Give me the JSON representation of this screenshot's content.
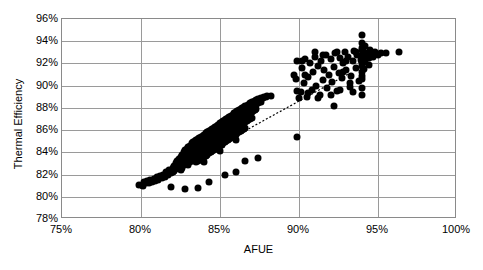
{
  "chart_data": {
    "type": "scatter",
    "title": "",
    "xlabel": "AFUE",
    "ylabel": "Thermal Efficiency",
    "xlim": [
      75,
      100
    ],
    "ylim": [
      78,
      96
    ],
    "grid": true,
    "legend": "none",
    "xtick_labels": [
      "75%",
      "80%",
      "85%",
      "90%",
      "95%",
      "100%"
    ],
    "xtick_values": [
      75,
      80,
      85,
      90,
      95,
      100
    ],
    "ytick_labels": [
      "78%",
      "80%",
      "82%",
      "84%",
      "86%",
      "88%",
      "90%",
      "92%",
      "94%",
      "96%"
    ],
    "ytick_values": [
      78,
      80,
      82,
      84,
      86,
      88,
      90,
      92,
      94,
      96
    ],
    "marker": {
      "shape": "circle",
      "color": "#000000",
      "size_px": 7
    },
    "trendline": {
      "style": "dotted",
      "color": "#000000",
      "x": [
        80.0,
        93.2
      ],
      "y": [
        80.6,
        91.0
      ]
    },
    "annotations": [],
    "points": [
      [
        79.9,
        81.1
      ],
      [
        80.1,
        81.0
      ],
      [
        80.2,
        81.3
      ],
      [
        80.3,
        81.2
      ],
      [
        80.4,
        81.4
      ],
      [
        80.5,
        81.2
      ],
      [
        80.6,
        81.5
      ],
      [
        80.7,
        81.3
      ],
      [
        80.8,
        81.6
      ],
      [
        80.9,
        81.4
      ],
      [
        81.0,
        81.8
      ],
      [
        81.1,
        81.5
      ],
      [
        81.2,
        81.9
      ],
      [
        81.3,
        81.7
      ],
      [
        81.4,
        82.0
      ],
      [
        81.5,
        81.8
      ],
      [
        81.6,
        82.2
      ],
      [
        81.7,
        82.0
      ],
      [
        81.8,
        82.4
      ],
      [
        81.9,
        82.1
      ],
      [
        82.0,
        82.6
      ],
      [
        82.0,
        82.2
      ],
      [
        82.1,
        82.8
      ],
      [
        82.1,
        82.3
      ],
      [
        82.2,
        83.0
      ],
      [
        82.2,
        82.5
      ],
      [
        82.3,
        83.2
      ],
      [
        82.3,
        82.6
      ],
      [
        82.4,
        83.4
      ],
      [
        82.4,
        82.8
      ],
      [
        82.5,
        83.6
      ],
      [
        82.5,
        83.0
      ],
      [
        82.5,
        82.4
      ],
      [
        82.6,
        83.8
      ],
      [
        82.6,
        83.2
      ],
      [
        82.6,
        82.6
      ],
      [
        82.7,
        84.0
      ],
      [
        82.7,
        83.4
      ],
      [
        82.7,
        82.9
      ],
      [
        82.8,
        84.2
      ],
      [
        82.8,
        83.6
      ],
      [
        82.8,
        83.1
      ],
      [
        82.9,
        84.3
      ],
      [
        82.9,
        83.8
      ],
      [
        82.9,
        83.3
      ],
      [
        83.0,
        84.5
      ],
      [
        83.0,
        84.0
      ],
      [
        83.0,
        83.5
      ],
      [
        83.0,
        82.9
      ],
      [
        83.1,
        84.6
      ],
      [
        83.1,
        84.1
      ],
      [
        83.1,
        83.6
      ],
      [
        83.1,
        83.1
      ],
      [
        83.2,
        84.8
      ],
      [
        83.2,
        84.3
      ],
      [
        83.2,
        83.8
      ],
      [
        83.2,
        83.3
      ],
      [
        83.3,
        84.9
      ],
      [
        83.3,
        84.4
      ],
      [
        83.3,
        83.9
      ],
      [
        83.3,
        83.4
      ],
      [
        83.4,
        85.0
      ],
      [
        83.4,
        84.5
      ],
      [
        83.4,
        84.0
      ],
      [
        83.4,
        83.5
      ],
      [
        83.5,
        85.1
      ],
      [
        83.5,
        84.6
      ],
      [
        83.5,
        84.1
      ],
      [
        83.5,
        83.6
      ],
      [
        83.5,
        83.1
      ],
      [
        83.6,
        85.2
      ],
      [
        83.6,
        84.7
      ],
      [
        83.6,
        84.2
      ],
      [
        83.6,
        83.7
      ],
      [
        83.6,
        83.2
      ],
      [
        83.7,
        85.3
      ],
      [
        83.7,
        84.8
      ],
      [
        83.7,
        84.3
      ],
      [
        83.7,
        83.8
      ],
      [
        83.7,
        83.3
      ],
      [
        83.8,
        85.4
      ],
      [
        83.8,
        84.9
      ],
      [
        83.8,
        84.4
      ],
      [
        83.8,
        83.9
      ],
      [
        83.8,
        83.4
      ],
      [
        83.9,
        85.5
      ],
      [
        83.9,
        85.0
      ],
      [
        83.9,
        84.5
      ],
      [
        83.9,
        84.0
      ],
      [
        83.9,
        83.5
      ],
      [
        84.0,
        85.6
      ],
      [
        84.0,
        85.1
      ],
      [
        84.0,
        84.6
      ],
      [
        84.0,
        84.1
      ],
      [
        84.0,
        83.6
      ],
      [
        84.0,
        83.1
      ],
      [
        84.1,
        85.7
      ],
      [
        84.1,
        85.2
      ],
      [
        84.1,
        84.7
      ],
      [
        84.1,
        84.2
      ],
      [
        84.1,
        83.7
      ],
      [
        84.2,
        85.8
      ],
      [
        84.2,
        85.3
      ],
      [
        84.2,
        84.8
      ],
      [
        84.2,
        84.3
      ],
      [
        84.2,
        83.8
      ],
      [
        84.3,
        85.9
      ],
      [
        84.3,
        85.4
      ],
      [
        84.3,
        84.9
      ],
      [
        84.3,
        84.4
      ],
      [
        84.3,
        83.9
      ],
      [
        84.4,
        86.0
      ],
      [
        84.4,
        85.5
      ],
      [
        84.4,
        85.0
      ],
      [
        84.4,
        84.5
      ],
      [
        84.4,
        84.0
      ],
      [
        84.5,
        86.1
      ],
      [
        84.5,
        85.6
      ],
      [
        84.5,
        85.1
      ],
      [
        84.5,
        84.6
      ],
      [
        84.5,
        84.1
      ],
      [
        84.6,
        86.2
      ],
      [
        84.6,
        85.7
      ],
      [
        84.6,
        85.2
      ],
      [
        84.6,
        84.7
      ],
      [
        84.6,
        84.2
      ],
      [
        84.7,
        86.3
      ],
      [
        84.7,
        85.8
      ],
      [
        84.7,
        85.3
      ],
      [
        84.7,
        84.8
      ],
      [
        84.7,
        84.3
      ],
      [
        84.8,
        86.4
      ],
      [
        84.8,
        85.9
      ],
      [
        84.8,
        85.4
      ],
      [
        84.8,
        84.9
      ],
      [
        84.8,
        84.4
      ],
      [
        84.9,
        86.5
      ],
      [
        84.9,
        86.0
      ],
      [
        84.9,
        85.5
      ],
      [
        84.9,
        85.0
      ],
      [
        84.9,
        84.5
      ],
      [
        85.0,
        86.6
      ],
      [
        85.0,
        86.1
      ],
      [
        85.0,
        85.6
      ],
      [
        85.0,
        85.1
      ],
      [
        85.0,
        84.6
      ],
      [
        85.0,
        84.1
      ],
      [
        85.1,
        86.7
      ],
      [
        85.1,
        86.2
      ],
      [
        85.1,
        85.7
      ],
      [
        85.1,
        85.2
      ],
      [
        85.1,
        84.7
      ],
      [
        85.2,
        86.8
      ],
      [
        85.2,
        86.3
      ],
      [
        85.2,
        85.8
      ],
      [
        85.2,
        85.3
      ],
      [
        85.2,
        84.8
      ],
      [
        85.3,
        86.9
      ],
      [
        85.3,
        86.4
      ],
      [
        85.3,
        85.9
      ],
      [
        85.3,
        85.4
      ],
      [
        85.3,
        84.9
      ],
      [
        85.4,
        87.0
      ],
      [
        85.4,
        86.5
      ],
      [
        85.4,
        86.0
      ],
      [
        85.4,
        85.5
      ],
      [
        85.4,
        85.0
      ],
      [
        85.5,
        87.1
      ],
      [
        85.5,
        86.6
      ],
      [
        85.5,
        86.1
      ],
      [
        85.5,
        85.6
      ],
      [
        85.5,
        85.1
      ],
      [
        85.6,
        87.2
      ],
      [
        85.6,
        86.7
      ],
      [
        85.6,
        86.2
      ],
      [
        85.6,
        85.7
      ],
      [
        85.6,
        85.2
      ],
      [
        85.7,
        87.3
      ],
      [
        85.7,
        86.8
      ],
      [
        85.7,
        86.3
      ],
      [
        85.7,
        85.8
      ],
      [
        85.7,
        85.3
      ],
      [
        85.8,
        87.4
      ],
      [
        85.8,
        86.9
      ],
      [
        85.8,
        86.4
      ],
      [
        85.8,
        85.9
      ],
      [
        85.8,
        85.4
      ],
      [
        85.9,
        87.5
      ],
      [
        85.9,
        87.0
      ],
      [
        85.9,
        86.5
      ],
      [
        85.9,
        86.0
      ],
      [
        85.9,
        85.5
      ],
      [
        86.0,
        87.6
      ],
      [
        86.0,
        87.1
      ],
      [
        86.0,
        86.6
      ],
      [
        86.0,
        86.1
      ],
      [
        86.0,
        85.6
      ],
      [
        86.0,
        85.1
      ],
      [
        86.1,
        87.7
      ],
      [
        86.1,
        87.2
      ],
      [
        86.1,
        86.7
      ],
      [
        86.1,
        86.2
      ],
      [
        86.1,
        85.7
      ],
      [
        86.2,
        87.8
      ],
      [
        86.2,
        87.3
      ],
      [
        86.2,
        86.8
      ],
      [
        86.2,
        86.3
      ],
      [
        86.2,
        85.8
      ],
      [
        86.3,
        87.9
      ],
      [
        86.3,
        87.4
      ],
      [
        86.3,
        86.9
      ],
      [
        86.3,
        86.4
      ],
      [
        86.3,
        85.9
      ],
      [
        86.4,
        88.0
      ],
      [
        86.4,
        87.5
      ],
      [
        86.4,
        87.0
      ],
      [
        86.4,
        86.5
      ],
      [
        86.4,
        86.0
      ],
      [
        86.5,
        88.1
      ],
      [
        86.5,
        87.6
      ],
      [
        86.5,
        87.1
      ],
      [
        86.5,
        86.6
      ],
      [
        86.5,
        86.1
      ],
      [
        86.6,
        88.2
      ],
      [
        86.6,
        87.7
      ],
      [
        86.6,
        87.2
      ],
      [
        86.6,
        86.7
      ],
      [
        86.6,
        86.2
      ],
      [
        86.7,
        88.2
      ],
      [
        86.7,
        87.8
      ],
      [
        86.7,
        87.3
      ],
      [
        86.7,
        86.8
      ],
      [
        86.8,
        88.3
      ],
      [
        86.8,
        87.9
      ],
      [
        86.8,
        87.4
      ],
      [
        86.8,
        86.9
      ],
      [
        86.9,
        88.4
      ],
      [
        86.9,
        88.0
      ],
      [
        86.9,
        87.5
      ],
      [
        86.9,
        87.0
      ],
      [
        87.0,
        88.5
      ],
      [
        87.0,
        88.1
      ],
      [
        87.0,
        87.6
      ],
      [
        87.0,
        87.1
      ],
      [
        87.1,
        88.5
      ],
      [
        87.1,
        88.2
      ],
      [
        87.1,
        87.7
      ],
      [
        87.2,
        88.6
      ],
      [
        87.2,
        88.3
      ],
      [
        87.2,
        87.8
      ],
      [
        87.3,
        88.7
      ],
      [
        87.3,
        88.3
      ],
      [
        87.3,
        87.9
      ],
      [
        87.4,
        88.8
      ],
      [
        87.4,
        88.4
      ],
      [
        87.5,
        88.8
      ],
      [
        87.5,
        88.5
      ],
      [
        87.6,
        88.9
      ],
      [
        87.6,
        88.5
      ],
      [
        87.7,
        88.9
      ],
      [
        87.8,
        89.0
      ],
      [
        87.9,
        89.0
      ],
      [
        88.0,
        89.1
      ],
      [
        88.2,
        89.1
      ],
      [
        82.8,
        80.7
      ],
      [
        83.6,
        80.8
      ],
      [
        84.3,
        81.3
      ],
      [
        81.9,
        80.9
      ],
      [
        85.3,
        82.0
      ],
      [
        86.0,
        82.2
      ],
      [
        86.6,
        83.2
      ],
      [
        87.4,
        83.5
      ],
      [
        89.9,
        85.4
      ],
      [
        89.8,
        90.6
      ],
      [
        89.9,
        92.2
      ],
      [
        90.0,
        88.9
      ],
      [
        90.1,
        89.4
      ],
      [
        90.2,
        91.6
      ],
      [
        90.3,
        90.2
      ],
      [
        90.4,
        92.4
      ],
      [
        90.5,
        89.0
      ],
      [
        90.6,
        90.8
      ],
      [
        90.7,
        92.0
      ],
      [
        90.8,
        89.6
      ],
      [
        90.9,
        91.2
      ],
      [
        91.0,
        92.6
      ],
      [
        91.1,
        90.0
      ],
      [
        91.2,
        91.8
      ],
      [
        91.3,
        89.2
      ],
      [
        91.4,
        92.2
      ],
      [
        91.5,
        90.5
      ],
      [
        91.6,
        91.4
      ],
      [
        91.7,
        92.8
      ],
      [
        91.8,
        89.8
      ],
      [
        91.9,
        91.0
      ],
      [
        92.0,
        92.4
      ],
      [
        92.1,
        90.3
      ],
      [
        92.2,
        91.7
      ],
      [
        92.3,
        92.9
      ],
      [
        92.4,
        89.5
      ],
      [
        92.5,
        91.1
      ],
      [
        92.6,
        92.5
      ],
      [
        92.7,
        90.7
      ],
      [
        92.8,
        92.0
      ],
      [
        92.9,
        93.0
      ],
      [
        93.0,
        91.4
      ],
      [
        93.1,
        92.6
      ],
      [
        93.2,
        89.9
      ],
      [
        93.3,
        90.9
      ],
      [
        93.4,
        92.2
      ],
      [
        93.5,
        93.1
      ],
      [
        93.6,
        91.6
      ],
      [
        93.7,
        92.8
      ],
      [
        93.8,
        90.4
      ],
      [
        93.9,
        92.3
      ],
      [
        94.0,
        93.2
      ],
      [
        94.0,
        92.0
      ],
      [
        94.0,
        91.2
      ],
      [
        94.0,
        90.6
      ],
      [
        94.0,
        89.8
      ],
      [
        94.0,
        89.2
      ],
      [
        94.0,
        93.8
      ],
      [
        94.0,
        94.6
      ],
      [
        94.0,
        92.7
      ],
      [
        94.0,
        91.8
      ],
      [
        94.0,
        90.9
      ],
      [
        94.0,
        93.4
      ],
      [
        94.1,
        92.4
      ],
      [
        94.1,
        91.5
      ],
      [
        94.1,
        93.0
      ],
      [
        94.2,
        92.1
      ],
      [
        94.2,
        93.6
      ],
      [
        94.3,
        92.8
      ],
      [
        94.4,
        92.5
      ],
      [
        94.5,
        93.2
      ],
      [
        94.6,
        92.9
      ],
      [
        94.7,
        92.6
      ],
      [
        94.8,
        93.0
      ],
      [
        95.0,
        92.8
      ],
      [
        95.2,
        92.9
      ],
      [
        95.5,
        92.9
      ],
      [
        96.3,
        93.0
      ],
      [
        90.2,
        92.2
      ],
      [
        91.5,
        92.8
      ],
      [
        92.4,
        93.0
      ],
      [
        93.0,
        92.2
      ],
      [
        89.9,
        89.5
      ],
      [
        90.6,
        89.3
      ],
      [
        91.2,
        88.9
      ],
      [
        92.0,
        89.2
      ],
      [
        92.6,
        89.6
      ],
      [
        93.4,
        89.4
      ],
      [
        92.2,
        88.2
      ],
      [
        91.0,
        93.0
      ],
      [
        93.6,
        93.0
      ],
      [
        89.7,
        91.0
      ],
      [
        90.4,
        91.0
      ],
      [
        92.8,
        91.2
      ],
      [
        93.2,
        90.2
      ],
      [
        94.4,
        91.9
      ]
    ]
  }
}
